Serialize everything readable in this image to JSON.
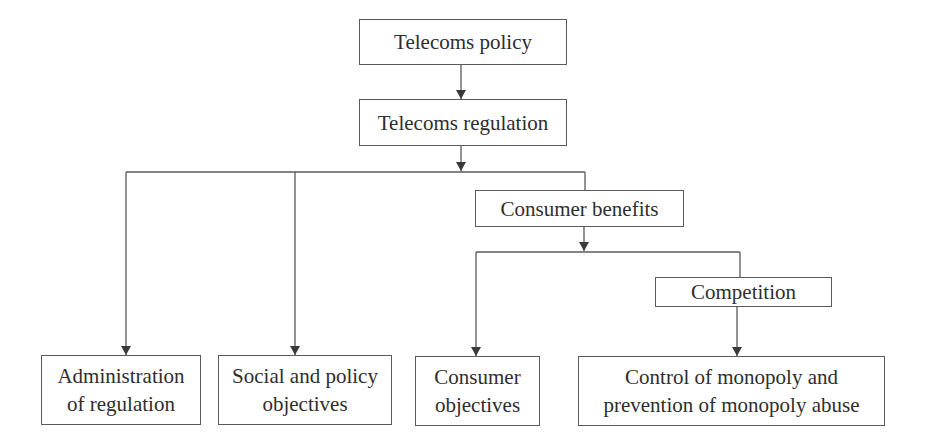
{
  "diagram": {
    "colors": {
      "line": "#5a5a5a",
      "text": "#2e2e2e",
      "background": "#ffffff"
    },
    "nodes": {
      "telecoms_policy": {
        "label": "Telecoms policy"
      },
      "telecoms_regulation": {
        "label": "Telecoms regulation"
      },
      "consumer_benefits": {
        "label": "Consumer benefits"
      },
      "competition": {
        "label": "Competition"
      },
      "administration": {
        "line1": "Administration",
        "line2": "of regulation"
      },
      "social_policy": {
        "line1": "Social and policy",
        "line2": "objectives"
      },
      "consumer_objectives": {
        "line1": "Consumer",
        "line2": "objectives"
      },
      "monopoly_control": {
        "line1": "Control of monopoly and",
        "line2": "prevention of monopoly abuse"
      }
    },
    "edges": [
      {
        "from": "Telecoms policy",
        "to": "Telecoms regulation"
      },
      {
        "from": "Telecoms regulation",
        "to": "Administration of regulation"
      },
      {
        "from": "Telecoms regulation",
        "to": "Social and policy objectives"
      },
      {
        "from": "Telecoms regulation",
        "to": "Consumer benefits"
      },
      {
        "from": "Consumer benefits",
        "to": "Consumer objectives"
      },
      {
        "from": "Consumer benefits",
        "to": "Competition"
      },
      {
        "from": "Competition",
        "to": "Control of monopoly and prevention of monopoly abuse"
      }
    ]
  }
}
